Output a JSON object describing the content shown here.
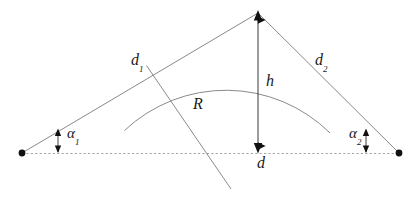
{
  "figure": {
    "type": "geometry-diagram",
    "background_color": "#ffffff",
    "line_color": "#808080",
    "marker_color": "#111111",
    "label_color": "#1a1a1a",
    "width": 419,
    "height": 199
  },
  "labels": {
    "d1": {
      "text": "d",
      "sub": "1",
      "x": 131,
      "y": 55
    },
    "d2": {
      "text": "d",
      "sub": "2",
      "x": 315,
      "y": 55
    },
    "alpha1": {
      "text": "α",
      "sub": "1",
      "x": 67,
      "y": 128
    },
    "alpha2": {
      "text": "α",
      "sub": "2",
      "x": 352,
      "y": 128
    },
    "h": {
      "text": "h",
      "sub": "",
      "x": 266,
      "y": 76
    },
    "d": {
      "text": "d",
      "sub": "",
      "x": 257,
      "y": 153
    },
    "R": {
      "text": "R",
      "sub": "",
      "x": 194,
      "y": 100
    }
  },
  "geometry": {
    "baseline": {
      "name": "horizontal-dashed-baseline",
      "x1": 22,
      "y1": 153,
      "x2": 399,
      "y2": 153,
      "style": "dashed",
      "color": "#9a9a9a"
    },
    "left_endpoint": {
      "x": 22,
      "y": 153,
      "radius": 3.2
    },
    "right_endpoint": {
      "x": 399,
      "y": 153,
      "radius": 3.2
    },
    "apex": {
      "x": 258,
      "y": 12
    },
    "left_tangent_line": {
      "x1": 22,
      "y1": 153,
      "x2": 258,
      "y2": 12
    },
    "right_tangent_line": {
      "x1": 258,
      "y1": 12,
      "x2": 399,
      "y2": 153
    },
    "tangency_point_1": {
      "x": 147,
      "y": 66
    },
    "tangency_point_2": {
      "x": 307,
      "y": 67
    },
    "arc": {
      "name": "circular-arc",
      "center_x": 232,
      "center_y": 190,
      "radius": 148,
      "start_x": 124,
      "start_y": 130,
      "end_x": 330,
      "end_y": 133,
      "apex_x": 232,
      "apex_y": 42
    },
    "radius_line": {
      "name": "radius-line-R",
      "x1": 147,
      "y1": 66,
      "x2": 231,
      "y2": 188
    },
    "height_arrow": {
      "name": "height-double-arrow",
      "x": 258,
      "y_top": 12,
      "y_bottom": 153
    },
    "angle_marker_left": {
      "x": 58,
      "y_top": 131,
      "y_bottom": 152
    },
    "angle_marker_right": {
      "x": 366,
      "y_top": 131,
      "y_bottom": 152
    }
  },
  "colors": {
    "stroke": "#8a8a8a",
    "baseline": "#a0a0a0",
    "arrow_fill": "#111111",
    "dot_fill": "#111111",
    "text": "#1a1a1a"
  }
}
